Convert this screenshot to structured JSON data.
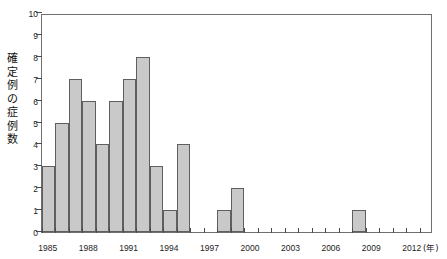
{
  "chart_data": {
    "type": "bar",
    "title": "",
    "xlabel": "年",
    "ylabel": "確定例の症例数",
    "ylim": [
      0,
      10
    ],
    "ytick_step": 1,
    "xlim": [
      1984.5,
      2013.5
    ],
    "grid": false,
    "legend": null,
    "bar_fill_color": "#c9c9c9",
    "bar_edge_color": "#5f5f5f",
    "axis_color": "#6f6f6f",
    "xtick_labels": [
      "1985",
      "1988",
      "1991",
      "1994",
      "1997",
      "2000",
      "2003",
      "2006",
      "2009",
      "2012"
    ],
    "xtick_values": [
      1985,
      1988,
      1991,
      1994,
      1997,
      2000,
      2003,
      2006,
      2009,
      2012
    ],
    "ytick_labels": [
      "0",
      "1",
      "2",
      "3",
      "4",
      "5",
      "6",
      "7",
      "8",
      "9",
      "10"
    ],
    "ytick_values": [
      0,
      1,
      2,
      3,
      4,
      5,
      6,
      7,
      8,
      9,
      10
    ],
    "categories": [
      1985,
      1986,
      1987,
      1988,
      1989,
      1990,
      1991,
      1992,
      1993,
      1994,
      1995,
      1996,
      1997,
      1998,
      1999,
      2000,
      2001,
      2002,
      2003,
      2004,
      2005,
      2006,
      2007,
      2008,
      2009,
      2010,
      2011,
      2012,
      2013
    ],
    "values": [
      3,
      5,
      7,
      6,
      4,
      6,
      7,
      8,
      3,
      1,
      4,
      0,
      0,
      1,
      2,
      0,
      0,
      0,
      0,
      0,
      0,
      0,
      0,
      1,
      0,
      0,
      0,
      0,
      0
    ],
    "xunit_label": "(年)"
  },
  "axis": {
    "ylabel_text": "確定例の症例数"
  }
}
